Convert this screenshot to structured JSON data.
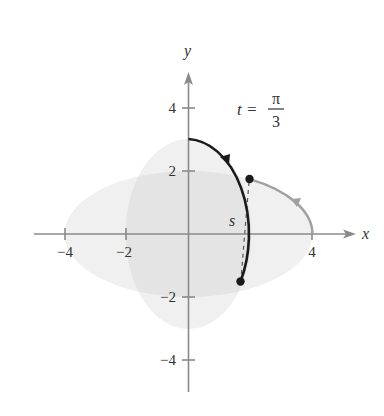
{
  "figure": {
    "axes": {
      "x_label": "x",
      "y_label": "y",
      "x_ticks": [
        {
          "value": -4,
          "label": "−4"
        },
        {
          "value": -2,
          "label": "−2"
        },
        {
          "value": 4,
          "label": "4"
        }
      ],
      "y_ticks": [
        {
          "value": 4,
          "label": "4"
        },
        {
          "value": 2,
          "label": "2"
        },
        {
          "value": -2,
          "label": "−2"
        },
        {
          "value": -4,
          "label": "−4"
        }
      ],
      "x_range": [
        -5,
        5.5
      ],
      "y_range": [
        -5,
        6
      ]
    },
    "annotation": {
      "t_label": "t =",
      "numerator": "π",
      "denominator": "3"
    },
    "segment_label": "s",
    "colors": {
      "axis": "#8a8a8a",
      "black_curve": "#1a1a1a",
      "gray_curve": "#a0a0a0",
      "shade": "#f0f0f0",
      "shade_overlap": "#e4e4e4"
    },
    "regions": [
      {
        "name": "horizontal-ellipse",
        "a": 4,
        "b": 2
      },
      {
        "name": "vertical-ellipse",
        "a": 2,
        "b": 3
      }
    ],
    "curves": [
      {
        "name": "black-path",
        "from": [
          0,
          3
        ],
        "to": [
          1.65,
          -1.5
        ],
        "direction": "clockwise"
      },
      {
        "name": "gray-path",
        "from": [
          4,
          0
        ],
        "to": [
          2,
          1.73
        ],
        "direction": "counterclockwise"
      }
    ],
    "points": [
      {
        "name": "gray-endpoint",
        "x": 2,
        "y": 1.73
      },
      {
        "name": "black-endpoint",
        "x": 1.65,
        "y": -1.5
      }
    ]
  }
}
